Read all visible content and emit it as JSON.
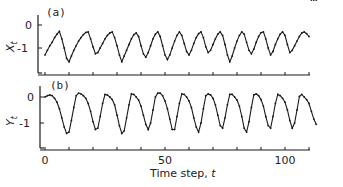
{
  "chart_data": [
    {
      "type": "line",
      "panel_label": "(a)",
      "ylabel": "X_t",
      "ylabel_main": "X",
      "ylabel_sub": "t",
      "xlabel": "",
      "yticks": [
        0,
        -1
      ],
      "ytick_labels": [
        "0",
        "-1"
      ],
      "ylim": [
        -1.9,
        0.45
      ],
      "xlim": [
        0,
        115
      ],
      "markers": true,
      "series": [
        {
          "name": "X_t",
          "x": [
            0,
            1,
            2,
            3,
            4,
            5,
            6,
            7,
            8,
            9,
            10,
            11,
            12,
            13,
            14,
            15,
            16,
            17,
            18,
            19,
            20,
            21,
            22,
            23,
            24,
            25,
            26,
            27,
            28,
            29,
            30,
            31,
            32,
            33,
            34,
            35,
            36,
            37,
            38,
            39,
            40,
            41,
            42,
            43,
            44,
            45,
            46,
            47,
            48,
            49,
            50,
            51,
            52,
            53,
            54,
            55,
            56,
            57,
            58,
            59,
            60,
            61,
            62,
            63,
            64,
            65,
            66,
            67,
            68,
            69,
            70,
            71,
            72,
            73,
            74,
            75,
            76,
            77,
            78,
            79,
            80,
            81,
            82,
            83,
            84,
            85,
            86,
            87,
            88,
            89,
            90,
            91,
            92,
            93,
            94,
            95,
            96,
            97,
            98,
            99,
            100,
            101,
            102,
            103,
            104,
            105,
            106,
            107,
            108,
            109,
            110,
            111,
            112,
            113
          ],
          "values": [
            -1.3,
            -1.1,
            -0.9,
            -0.75,
            -0.55,
            -0.4,
            -0.28,
            -0.6,
            -1.0,
            -1.45,
            -1.6,
            -1.35,
            -1.1,
            -0.9,
            -0.7,
            -0.55,
            -0.42,
            -0.32,
            -0.3,
            -0.6,
            -0.95,
            -1.25,
            -1.2,
            -1.0,
            -0.8,
            -0.6,
            -0.45,
            -0.35,
            -0.3,
            -0.55,
            -0.9,
            -1.3,
            -1.6,
            -1.35,
            -1.1,
            -0.85,
            -0.6,
            -0.42,
            -0.35,
            -0.5,
            -0.9,
            -1.25,
            -1.4,
            -1.2,
            -0.9,
            -0.6,
            -0.4,
            -0.3,
            -0.5,
            -0.9,
            -1.3,
            -1.5,
            -1.3,
            -1.0,
            -0.7,
            -0.45,
            -0.3,
            -0.45,
            -0.8,
            -1.15,
            -1.3,
            -1.1,
            -0.8,
            -0.55,
            -0.38,
            -0.3,
            -0.55,
            -0.95,
            -1.2,
            -1.1,
            -0.85,
            -0.6,
            -0.4,
            -0.3,
            -0.45,
            -0.85,
            -1.3,
            -1.6,
            -1.35,
            -1.0,
            -0.7,
            -0.45,
            -0.3,
            -0.4,
            -0.75,
            -1.1,
            -1.25,
            -1.05,
            -0.75,
            -0.5,
            -0.33,
            -0.3,
            -0.6,
            -1.0,
            -1.3,
            -1.15,
            -0.85,
            -0.6,
            -0.4,
            -0.3,
            -0.45,
            -0.85,
            -1.2,
            -1.1,
            -0.9,
            -0.7,
            -0.5,
            -0.35,
            -0.3,
            -0.38,
            -0.5
          ]
        }
      ]
    },
    {
      "type": "line",
      "panel_label": "(b)",
      "ylabel": "Y_t",
      "ylabel_main": "Y",
      "ylabel_sub": "t",
      "xlabel": "Time step, t",
      "xlabel_main": "Time step, ",
      "xlabel_var": "t",
      "xticks": [
        0,
        10,
        20,
        30,
        40,
        50,
        60,
        70,
        80,
        90,
        100,
        110
      ],
      "xtick_labels_shown": {
        "0": "0",
        "50": "50",
        "100": "100"
      },
      "yticks": [
        0,
        -1
      ],
      "ytick_labels": [
        "0",
        "-1"
      ],
      "ylim": [
        -1.9,
        0.45
      ],
      "xlim": [
        0,
        115
      ],
      "markers": true,
      "series": [
        {
          "name": "Y_t",
          "x": [
            0,
            1,
            2,
            3,
            4,
            5,
            6,
            7,
            8,
            9,
            10,
            11,
            12,
            13,
            14,
            15,
            16,
            17,
            18,
            19,
            20,
            21,
            22,
            23,
            24,
            25,
            26,
            27,
            28,
            29,
            30,
            31,
            32,
            33,
            34,
            35,
            36,
            37,
            38,
            39,
            40,
            41,
            42,
            43,
            44,
            45,
            46,
            47,
            48,
            49,
            50,
            51,
            52,
            53,
            54,
            55,
            56,
            57,
            58,
            59,
            60,
            61,
            62,
            63,
            64,
            65,
            66,
            67,
            68,
            69,
            70,
            71,
            72,
            73,
            74,
            75,
            76,
            77,
            78,
            79,
            80,
            81,
            82,
            83,
            84,
            85,
            86,
            87,
            88,
            89,
            90,
            91,
            92,
            93,
            94,
            95,
            96,
            97,
            98,
            99,
            100,
            101,
            102,
            103,
            104,
            105,
            106,
            107,
            108,
            109,
            110,
            111,
            112,
            113
          ],
          "values": [
            0.0,
            0.05,
            0.08,
            0.05,
            -0.05,
            -0.2,
            -0.45,
            -0.8,
            -1.15,
            -1.4,
            -1.35,
            -0.9,
            -0.4,
            0.05,
            0.15,
            0.12,
            0.05,
            -0.05,
            -0.25,
            -0.55,
            -0.95,
            -1.25,
            -1.2,
            -0.75,
            -0.25,
            0.1,
            0.08,
            0.0,
            -0.1,
            -0.3,
            -0.7,
            -1.1,
            -1.4,
            -1.3,
            -0.8,
            -0.3,
            0.12,
            0.1,
            0.0,
            -0.12,
            -0.35,
            -0.7,
            -1.05,
            -1.25,
            -1.0,
            -0.5,
            0.0,
            0.15,
            0.15,
            0.05,
            -0.15,
            -0.45,
            -0.85,
            -1.25,
            -1.25,
            -0.75,
            -0.25,
            0.12,
            0.1,
            0.0,
            -0.15,
            -0.4,
            -0.8,
            -1.15,
            -1.35,
            -1.0,
            -0.45,
            0.05,
            0.12,
            0.08,
            -0.05,
            -0.3,
            -0.7,
            -1.1,
            -1.2,
            -0.8,
            -0.3,
            0.1,
            0.1,
            0.0,
            -0.12,
            -0.35,
            -0.75,
            -1.2,
            -1.35,
            -0.95,
            -0.4,
            0.08,
            0.12,
            0.05,
            -0.1,
            -0.35,
            -0.75,
            -1.1,
            -1.2,
            -0.75,
            -0.25,
            0.1,
            0.05,
            -0.05,
            -0.2,
            -0.5,
            -0.9,
            -1.2,
            -1.0,
            -0.5,
            0.02,
            0.1,
            0.0,
            -0.1,
            -0.25,
            -0.55,
            -0.85,
            -1.05
          ]
        }
      ]
    }
  ],
  "colors": {
    "line": "#1a1a1a",
    "axis": "#1a1a1a",
    "background": "#ffffff"
  }
}
